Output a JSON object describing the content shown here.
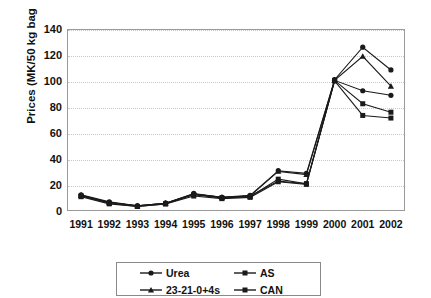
{
  "chart_data": {
    "type": "line",
    "title": "",
    "xlabel": "",
    "ylabel": "Prices (MK/50 kg bag",
    "categories": [
      "1991",
      "1992",
      "1993",
      "1994",
      "1995",
      "1996",
      "1997",
      "1998",
      "1999",
      "2000",
      "2001",
      "2002"
    ],
    "x": [
      1991,
      1992,
      1993,
      1994,
      1995,
      1996,
      1997,
      1998,
      1999,
      2000,
      2001,
      2002
    ],
    "ylim": [
      0,
      140
    ],
    "yticks": [
      0,
      20,
      40,
      60,
      80,
      100,
      120,
      140
    ],
    "grid": true,
    "legend_position": "bottom",
    "series": [
      {
        "name": "Urea",
        "marker": "circle",
        "values": [
          12.5,
          7.0,
          4.0,
          6.0,
          13.5,
          10.5,
          12.0,
          31.0,
          29.0,
          101.0,
          126.0,
          108.5
        ]
      },
      {
        "name": "AS",
        "marker": "square",
        "values": [
          11.5,
          6.0,
          3.5,
          5.5,
          12.5,
          10.0,
          11.0,
          24.5,
          21.0,
          100.5,
          82.5,
          76.0
        ]
      },
      {
        "name": "23-21-0+4s",
        "marker": "triangle",
        "values": [
          12.0,
          6.5,
          4.0,
          6.0,
          13.0,
          10.5,
          11.5,
          30.5,
          28.0,
          100.5,
          119.0,
          96.0
        ]
      },
      {
        "name": "CAN",
        "marker": "square",
        "values": [
          11.0,
          5.5,
          3.5,
          5.5,
          11.5,
          9.5,
          10.5,
          22.5,
          20.5,
          100.0,
          73.5,
          71.5
        ]
      },
      {
        "name": "Urea-2",
        "marker": "circle",
        "values": [
          12.0,
          6.5,
          4.0,
          6.0,
          13.0,
          10.5,
          11.5,
          23.0,
          21.0,
          100.5,
          92.5,
          89.0
        ]
      }
    ],
    "annotations": []
  },
  "legend": {
    "entries": [
      {
        "label": "Urea",
        "marker": "circle"
      },
      {
        "label": "AS",
        "marker": "square"
      },
      {
        "label": "23-21-0+4s",
        "marker": "triangle"
      },
      {
        "label": "CAN",
        "marker": "square"
      }
    ]
  },
  "style": {
    "line_color": "#1a1a1a",
    "grid_color": "#c8c8c8",
    "frame_color": "#9a9a9a",
    "text_color": "#111111",
    "background": "#ffffff"
  }
}
